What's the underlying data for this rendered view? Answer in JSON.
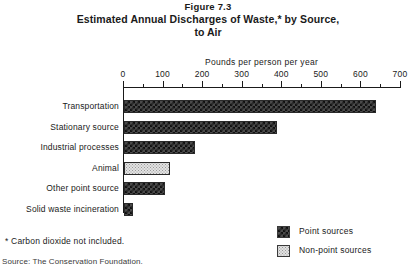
{
  "figure": {
    "number": "Figure 7.3",
    "title_line1": "Estimated Annual Discharges of Waste,* by Source,",
    "title_line2": "to Air"
  },
  "footnote": "*  Carbon dioxide not included.",
  "source": "Source: The Conservation Foundation.",
  "legend": {
    "position": "bottom-right",
    "items": [
      {
        "label": "Point sources",
        "pattern": "dark-checkerboard",
        "color": "#2a2a2a"
      },
      {
        "label": "Non-point sources",
        "pattern": "light-stipple",
        "color": "#e2e2e2"
      }
    ]
  },
  "chart_data": {
    "type": "bar",
    "orientation": "horizontal",
    "title": "Estimated Annual Discharges of Waste,* by Source, to Air",
    "xlabel": "Pounds per person per year",
    "ylabel": "",
    "xlim": [
      0,
      700
    ],
    "xticks": [
      0,
      100,
      200,
      300,
      400,
      500,
      600,
      700
    ],
    "xtick_labels": [
      "0",
      "100",
      "200",
      "300",
      "400",
      "500",
      "600",
      "700"
    ],
    "minor_tick_interval": 50,
    "grid": false,
    "categories": [
      "Transportation",
      "Stationary source",
      "Industrial processes",
      "Animal",
      "Other point source",
      "Solid waste incineration"
    ],
    "values": [
      637,
      387,
      180,
      116,
      104,
      23
    ],
    "source_types": [
      "Point sources",
      "Point sources",
      "Point sources",
      "Non-point sources",
      "Point sources",
      "Point sources"
    ]
  }
}
